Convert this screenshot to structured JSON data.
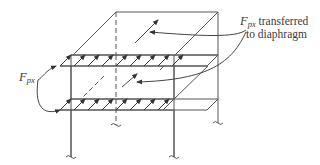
{
  "figure": {
    "type": "structural-diagram"
  },
  "labels": {
    "transfer": {
      "symbol": "F",
      "subscript": "px",
      "line1_rest": " transferred",
      "line2": "to diaphragm"
    },
    "force": {
      "symbol": "F",
      "subscript": "px"
    }
  },
  "colors": {
    "line": "#555555",
    "text": "#3a3a3a",
    "background": "#ffffff"
  }
}
